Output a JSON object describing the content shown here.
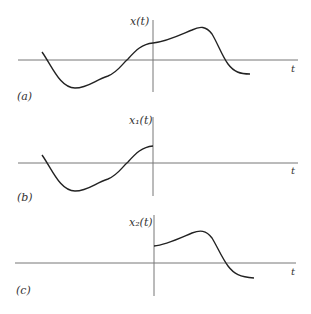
{
  "figure": {
    "panels": [
      {
        "id": "a",
        "panel_label": "(a)",
        "y_label": "x(t)",
        "x_label": "t",
        "description": "Full signal x(t), defined for all t"
      },
      {
        "id": "b",
        "panel_label": "(b)",
        "y_label": "x₁(t)",
        "x_label": "t",
        "description": "Portion of x(t) for t < 0"
      },
      {
        "id": "c",
        "panel_label": "(c)",
        "y_label": "x₂(t)",
        "x_label": "t",
        "description": "Portion of x(t) for t ≥ 0"
      }
    ]
  },
  "style": {
    "axis_color": "#777777",
    "curve_color": "#222222",
    "background": "#ffffff"
  }
}
